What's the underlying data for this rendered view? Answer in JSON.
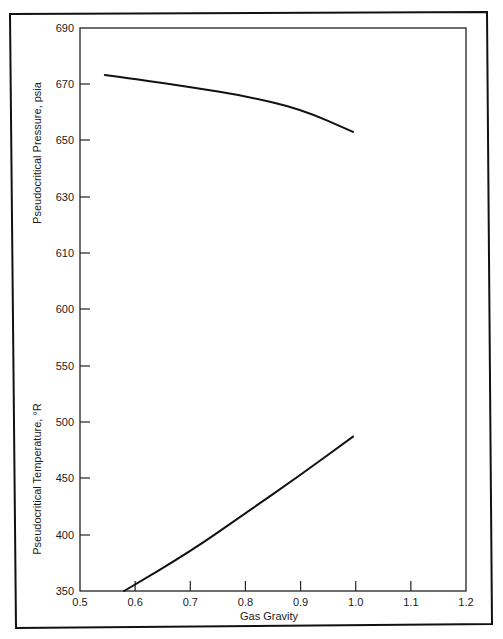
{
  "chart_data": {
    "type": "line",
    "title": "",
    "xlabel": "Gas Gravity",
    "ylabel_upper": "Pseudocritical Pressure, psia",
    "ylabel_lower": "Pseudocritical Temperature, °R",
    "xlim": [
      0.5,
      1.2
    ],
    "x_ticks": [
      "0.5",
      "0.6",
      "0.7",
      "0.8",
      "0.9",
      "1.0",
      "1.1",
      "1.2"
    ],
    "y_ticks_pressure": [
      "690",
      "670",
      "650",
      "630",
      "610",
      "600"
    ],
    "y_ticks_temperature": [
      "550",
      "500",
      "450",
      "400",
      "350"
    ],
    "grid": false,
    "legend": "none",
    "series": [
      {
        "name": "Pseudocritical Pressure, psia",
        "axis": "upper",
        "x": [
          0.545,
          0.6,
          0.7,
          0.8,
          0.9,
          0.995
        ],
        "y": [
          673.2,
          671.8,
          668.9,
          665.7,
          661.1,
          652.9
        ]
      },
      {
        "name": "Pseudocritical Temperature, °R",
        "axis": "lower",
        "x": [
          0.58,
          0.7,
          0.8,
          0.9,
          0.995
        ],
        "y": [
          350,
          385,
          419,
          453,
          487
        ]
      }
    ]
  }
}
